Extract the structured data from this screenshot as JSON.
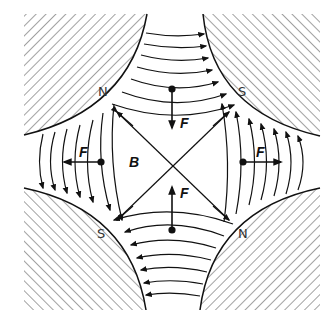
{
  "diagram": {
    "poles": [
      {
        "position": "top-left",
        "label": "N"
      },
      {
        "position": "top-right",
        "label": "S"
      },
      {
        "position": "bottom-left",
        "label": "S"
      },
      {
        "position": "bottom-right",
        "label": "N"
      }
    ],
    "field_label": "B",
    "force_labels": [
      "F",
      "F",
      "F",
      "F"
    ],
    "colors": {
      "line": "#111111",
      "hatch": "#8a8a8a",
      "text": "#333333"
    }
  }
}
